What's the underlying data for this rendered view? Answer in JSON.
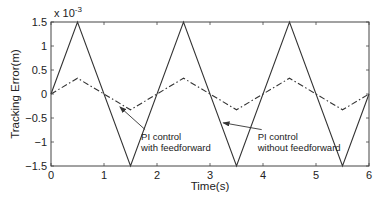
{
  "chart_data": {
    "type": "line",
    "title": "",
    "xlabel": "Time(s)",
    "ylabel": "Tracking Error(m)",
    "y_scale_label": "x 10",
    "y_scale_exponent": "-3",
    "xlim": [
      0,
      6
    ],
    "ylim": [
      -1.5,
      1.5
    ],
    "x_ticks": [
      0,
      1,
      2,
      3,
      4,
      5,
      6
    ],
    "x_tick_labels": [
      "0",
      "1",
      "2",
      "3",
      "4",
      "5",
      "6"
    ],
    "y_ticks": [
      1.5,
      1,
      0.5,
      0,
      -0.5,
      -1,
      -1.5
    ],
    "y_tick_labels": [
      "1.5",
      "1",
      "0.5",
      "0",
      "-0.5",
      "-1",
      "-1.5"
    ],
    "grid": false,
    "legend": null,
    "series": [
      {
        "name": "PI control without feedforward",
        "style": "solid",
        "color": "#333333",
        "x": [
          0,
          0.5,
          1.5,
          2.5,
          3.5,
          4.5,
          5.5,
          6
        ],
        "y": [
          0,
          1.5,
          -1.5,
          1.5,
          -1.5,
          1.5,
          -1.5,
          0
        ]
      },
      {
        "name": "PI control with feedforward",
        "style": "dash-dot",
        "color": "#333333",
        "x": [
          0,
          0.5,
          1.5,
          2.5,
          3.5,
          4.5,
          5.5,
          6
        ],
        "y": [
          0,
          0.33,
          -0.33,
          0.33,
          -0.33,
          0.33,
          -0.33,
          0
        ]
      }
    ],
    "annotations": [
      {
        "text_lines": [
          "PI control",
          "with feedforward"
        ],
        "arrow_to": [
          1.3,
          -0.27
        ],
        "text_at": [
          1.7,
          -0.95
        ]
      },
      {
        "text_lines": [
          "PI control",
          "without feedforward"
        ],
        "arrow_to": [
          3.25,
          -0.6
        ],
        "text_at": [
          3.9,
          -0.95
        ]
      }
    ]
  }
}
